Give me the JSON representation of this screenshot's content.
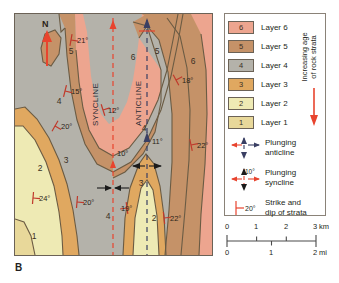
{
  "figure": {
    "panel_letter": "B",
    "type": "geologic-map-plunging-folds"
  },
  "map": {
    "north_label": "N",
    "fold_axes": [
      {
        "name": "syncline",
        "label": "SYNCLINE",
        "plunge": "10°",
        "color": "#e8442e"
      },
      {
        "name": "anticline",
        "label": "ANTICLINE",
        "plunge": "11°",
        "color": "#3a3f63"
      }
    ],
    "unit_labels": [
      {
        "unit": "6",
        "x": 118,
        "y": 46
      },
      {
        "unit": "6",
        "x": 178,
        "y": 50
      },
      {
        "unit": "5",
        "x": 56,
        "y": 40
      },
      {
        "unit": "5",
        "x": 142,
        "y": 40
      },
      {
        "unit": "4",
        "x": 44,
        "y": 90
      },
      {
        "unit": "4",
        "x": 129,
        "y": 117
      },
      {
        "unit": "4",
        "x": 93,
        "y": 205
      },
      {
        "unit": "3",
        "x": 51,
        "y": 149
      },
      {
        "unit": "3",
        "x": 126,
        "y": 172
      },
      {
        "unit": "2",
        "x": 25,
        "y": 157
      },
      {
        "unit": "2",
        "x": 139,
        "y": 207
      },
      {
        "unit": "1",
        "x": 19,
        "y": 225
      }
    ],
    "dip_readings": [
      {
        "value": "21°",
        "x": 62,
        "y": 26,
        "strike_rot": 100
      },
      {
        "value": "15°",
        "x": 56,
        "y": 77,
        "strike_rot": 104
      },
      {
        "value": "12°",
        "x": 93,
        "y": 96,
        "strike_rot": 72
      },
      {
        "value": "18°",
        "x": 167,
        "y": 66,
        "strike_rot": 62
      },
      {
        "value": "20°",
        "x": 46,
        "y": 112,
        "strike_rot": 120
      },
      {
        "value": "22°",
        "x": 182,
        "y": 131,
        "strike_rot": 78
      },
      {
        "value": "24°",
        "x": 24,
        "y": 184,
        "strike_rot": 95
      },
      {
        "value": "20°",
        "x": 68,
        "y": 188,
        "strike_rot": 95
      },
      {
        "value": "19°",
        "x": 106,
        "y": 194,
        "strike_rot": 80
      },
      {
        "value": "22°",
        "x": 155,
        "y": 204,
        "strike_rot": 85
      }
    ]
  },
  "legend": {
    "layers": [
      {
        "id": "6",
        "label": "Layer 6",
        "color": "#eda58f"
      },
      {
        "id": "5",
        "label": "Layer 5",
        "color": "#c59268"
      },
      {
        "id": "4",
        "label": "Layer 4",
        "color": "#b4b2aa"
      },
      {
        "id": "3",
        "label": "Layer 3",
        "color": "#e0a860"
      },
      {
        "id": "2",
        "label": "Layer 2",
        "color": "#eeeab4"
      },
      {
        "id": "1",
        "label": "Layer 1",
        "color": "#e8d89a"
      }
    ],
    "age_axis": {
      "line1": "Increasing age",
      "line2": "of rock strata",
      "arrow_color": "#e8442e"
    },
    "symbols": [
      {
        "name": "plunging-anticline",
        "line1": "Plunging",
        "line2": "anticline",
        "color": "#3a3f63",
        "angle": ""
      },
      {
        "name": "plunging-syncline",
        "line1": "Plunging",
        "line2": "syncline",
        "color": "#e8442e",
        "angle": "10°"
      },
      {
        "name": "strike-and-dip",
        "line1": "Strike and",
        "line2": "dip of strata",
        "color": "#e8442e",
        "angle": "20°"
      }
    ]
  },
  "scale": {
    "km": {
      "ticks": [
        "0",
        "1",
        "2",
        "3"
      ],
      "unit": "km"
    },
    "mi": {
      "ticks": [
        "0",
        "1",
        "2"
      ],
      "unit": "mi"
    }
  },
  "chart_data": {
    "type": "map",
    "map_kind": "geologic-structure-map",
    "stratigraphy": {
      "order_oldest_to_youngest": [
        "1",
        "2",
        "3",
        "4",
        "5",
        "6"
      ],
      "note": "Increasing age of rock strata downward (Layer 1 oldest)",
      "colors": {
        "1": "#e8d89a",
        "2": "#eeeab4",
        "3": "#e0a860",
        "4": "#b4b2aa",
        "5": "#c59268",
        "6": "#eda58f"
      }
    },
    "structures": [
      {
        "type": "plunging syncline",
        "label": "SYNCLINE",
        "plunge_deg": 10,
        "plunge_direction": "north",
        "axis_color": "#e8442e"
      },
      {
        "type": "plunging anticline",
        "label": "ANTICLINE",
        "plunge_deg": 11,
        "plunge_direction": "north",
        "axis_color": "#3a3f63"
      }
    ],
    "strike_dip_measurements_deg": [
      21,
      15,
      12,
      18,
      20,
      22,
      24,
      20,
      19,
      22
    ],
    "scale_km": [
      0,
      1,
      2,
      3
    ],
    "scale_mi": [
      0,
      1,
      2
    ],
    "orientation": "north up"
  }
}
